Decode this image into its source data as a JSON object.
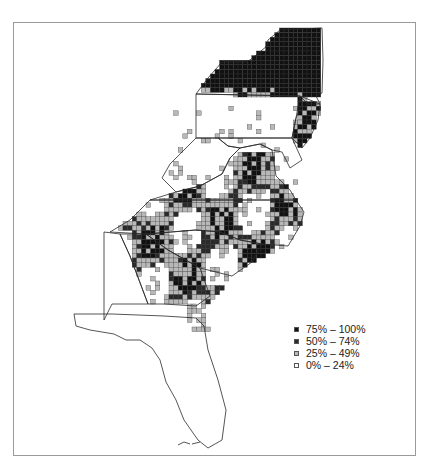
{
  "title": "",
  "legend": [
    {
      "label": "75% – 100%",
      "category": 3,
      "color": "#111111"
    },
    {
      "label": "50% – 74%",
      "category": 2,
      "color": "#2a2a2a"
    },
    {
      "label": "25% – 49%",
      "category": 1,
      "color": "#b8b8b8"
    },
    {
      "label": "0% – 24%",
      "category": 0,
      "color": "#ffffff"
    }
  ],
  "states": [
    "New York",
    "Pennsylvania",
    "New Jersey",
    "Delaware",
    "Maryland",
    "West Virginia",
    "Virginia",
    "North Carolina",
    "South Carolina",
    "Georgia",
    "Florida",
    "Alabama"
  ],
  "region_summary": [
    {
      "region": "New York",
      "predominant_category": "75% – 100%"
    },
    {
      "region": "Northern Pennsylvania border",
      "predominant_category": "25% – 49%"
    },
    {
      "region": "Pennsylvania",
      "predominant_category": "0% – 24%"
    },
    {
      "region": "New Jersey",
      "predominant_category": "75% – 100%"
    },
    {
      "region": "West Virginia",
      "predominant_category": "0% – 24%"
    },
    {
      "region": "Eastern Virginia",
      "predominant_category": "50% – 74%"
    },
    {
      "region": "North Carolina",
      "predominant_category": "50% – 74%"
    },
    {
      "region": "South Carolina",
      "predominant_category": "75% – 100%"
    },
    {
      "region": "Eastern Georgia",
      "predominant_category": "75% – 100%"
    },
    {
      "region": "Northeast Florida",
      "predominant_category": "25% – 49%"
    },
    {
      "region": "Peninsular Florida",
      "predominant_category": "0% – 24%"
    }
  ]
}
